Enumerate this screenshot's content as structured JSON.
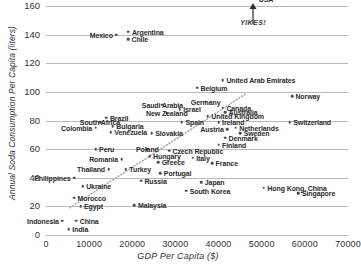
{
  "chart_data": {
    "type": "scatter",
    "title": "",
    "xlabel": "GDP Per Capita ($)",
    "ylabel": "Annual Soda Consumption Per Capita (liters)",
    "xlim": [
      0,
      70000
    ],
    "ylim": [
      0,
      160
    ],
    "xticks": [
      0,
      10000,
      20000,
      30000,
      40000,
      50000,
      60000,
      70000
    ],
    "yticks": [
      0,
      20,
      40,
      60,
      80,
      100,
      120,
      140,
      160
    ],
    "grid": "horizontal",
    "legend": "none",
    "marker_color": "#4a4a4a",
    "gridline_color": "#b9b9b9",
    "annotations": [
      {
        "text": "YIKES!",
        "x": 48000,
        "y": 148,
        "style": "italic"
      }
    ],
    "trendline": {
      "style": "dotted",
      "color": "#b0b0b0",
      "x0": 5500,
      "y0": 19,
      "x1": 46500,
      "y1": 99
    },
    "points": [
      {
        "label": "USA",
        "x": 48500,
        "y": 165,
        "lp": "l"
      },
      {
        "label": "Mexico",
        "x": 16300,
        "y": 140,
        "lp": "r"
      },
      {
        "label": "Argentina",
        "x": 19100,
        "y": 142,
        "lp": "l"
      },
      {
        "label": "Chile",
        "x": 19000,
        "y": 137,
        "lp": "l"
      },
      {
        "label": "United Arab Emirates",
        "x": 41000,
        "y": 108,
        "lp": "l"
      },
      {
        "label": "Belgium",
        "x": 35000,
        "y": 103,
        "lp": "l"
      },
      {
        "label": "Norway",
        "x": 57000,
        "y": 97,
        "lp": "l"
      },
      {
        "label": "Saudi Arabia",
        "x": 27000,
        "y": 91,
        "lp": "c"
      },
      {
        "label": "Germany",
        "x": 37000,
        "y": 93,
        "lp": "c"
      },
      {
        "label": "Australia",
        "x": 41500,
        "y": 86,
        "lp": "l"
      },
      {
        "label": "Canada",
        "x": 41000,
        "y": 89,
        "lp": "l"
      },
      {
        "label": "Israel",
        "x": 31000,
        "y": 88,
        "lp": "l"
      },
      {
        "label": "New Zealand",
        "x": 28000,
        "y": 85,
        "lp": "c"
      },
      {
        "label": "Brazil",
        "x": 14000,
        "y": 82,
        "lp": "l"
      },
      {
        "label": "United Kingdom",
        "x": 37500,
        "y": 83,
        "lp": "l"
      },
      {
        "label": "Switzerland",
        "x": 56500,
        "y": 79,
        "lp": "l"
      },
      {
        "label": "South Africa",
        "x": 12500,
        "y": 79,
        "lp": "c"
      },
      {
        "label": "Spain",
        "x": 31500,
        "y": 79,
        "lp": "l"
      },
      {
        "label": "Ireland",
        "x": 40000,
        "y": 79,
        "lp": "l"
      },
      {
        "label": "Netherlands",
        "x": 44000,
        "y": 75,
        "lp": "l"
      },
      {
        "label": "Austria",
        "x": 42000,
        "y": 74,
        "lp": "r"
      },
      {
        "label": "Colombia",
        "x": 11500,
        "y": 75,
        "lp": "r"
      },
      {
        "label": "Bulgaria",
        "x": 15500,
        "y": 76,
        "lp": "l"
      },
      {
        "label": "Venezuela",
        "x": 15000,
        "y": 72,
        "lp": "l"
      },
      {
        "label": "Slovakia",
        "x": 24500,
        "y": 71,
        "lp": "l"
      },
      {
        "label": "Sweden",
        "x": 45000,
        "y": 71,
        "lp": "l"
      },
      {
        "label": "Denmark",
        "x": 41500,
        "y": 68,
        "lp": "l"
      },
      {
        "label": "Finland",
        "x": 40000,
        "y": 63,
        "lp": "l"
      },
      {
        "label": "Peru",
        "x": 11500,
        "y": 60,
        "lp": "l"
      },
      {
        "label": "Poland",
        "x": 23500,
        "y": 60,
        "lp": "c"
      },
      {
        "label": "Czech Republic",
        "x": 28500,
        "y": 59,
        "lp": "l"
      },
      {
        "label": "Hungary",
        "x": 24000,
        "y": 55,
        "lp": "l"
      },
      {
        "label": "Italy",
        "x": 34000,
        "y": 54,
        "lp": "l"
      },
      {
        "label": "Romania",
        "x": 17500,
        "y": 53,
        "lp": "r"
      },
      {
        "label": "Greece",
        "x": 26000,
        "y": 51,
        "lp": "l"
      },
      {
        "label": "Thailand",
        "x": 14500,
        "y": 46,
        "lp": "r"
      },
      {
        "label": "Turkey",
        "x": 18500,
        "y": 46,
        "lp": "l"
      },
      {
        "label": "France",
        "x": 38500,
        "y": 50,
        "lp": "l"
      },
      {
        "label": "Portugal",
        "x": 26500,
        "y": 43,
        "lp": "l"
      },
      {
        "label": "Philippines",
        "x": 6500,
        "y": 40,
        "lp": "r"
      },
      {
        "label": "Russia",
        "x": 22000,
        "y": 38,
        "lp": "l"
      },
      {
        "label": "Japan",
        "x": 36000,
        "y": 37,
        "lp": "l"
      },
      {
        "label": "Ukraine",
        "x": 8500,
        "y": 34,
        "lp": "l"
      },
      {
        "label": "Hong Kong, China",
        "x": 50500,
        "y": 33,
        "lp": "l"
      },
      {
        "label": "South Korea",
        "x": 32500,
        "y": 31,
        "lp": "l"
      },
      {
        "label": "Singapore",
        "x": 58500,
        "y": 29,
        "lp": "l"
      },
      {
        "label": "Morocco",
        "x": 6500,
        "y": 26,
        "lp": "l"
      },
      {
        "label": "Egypt",
        "x": 8000,
        "y": 20,
        "lp": "l"
      },
      {
        "label": "Malaysia",
        "x": 20500,
        "y": 21,
        "lp": "l"
      },
      {
        "label": "Indonesia",
        "x": 3800,
        "y": 10,
        "lp": "r"
      },
      {
        "label": "China",
        "x": 7000,
        "y": 10,
        "lp": "l"
      },
      {
        "label": "India",
        "x": 5300,
        "y": 4,
        "lp": "l"
      }
    ]
  }
}
